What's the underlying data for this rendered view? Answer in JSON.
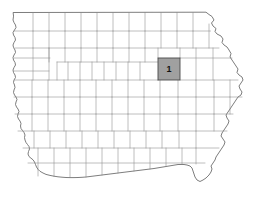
{
  "map": {
    "title": "Iowa county map",
    "region_name": "Iowa",
    "background_color": "#ffffff",
    "county_line_color": "#8a8a8a",
    "state_outline_color": "#6e6e6e",
    "highlight": {
      "label": "1",
      "fill_color": "#a0a0a0",
      "stroke_color": "#4a4a4a",
      "label_color": "#111111",
      "position": {
        "x": 158,
        "y": 58,
        "width": 22,
        "height": 22
      },
      "center": {
        "x": 169,
        "y": 69
      }
    },
    "legend_items": [
      {
        "symbol": "1",
        "swatch_color": "#a0a0a0"
      }
    ]
  },
  "chart_data": {
    "type": "map",
    "series": [
      {
        "name": "highlighted-county",
        "values": [
          {
            "label": "1",
            "value": 1,
            "fill": "#a0a0a0",
            "cx": 169,
            "cy": 69
          }
        ]
      }
    ],
    "legend": [
      "1"
    ],
    "grid": false
  }
}
